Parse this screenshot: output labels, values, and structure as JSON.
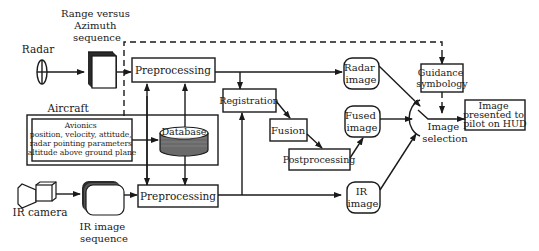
{
  "diagram": {
    "sources": {
      "radar": "Radar",
      "range_azimuth": [
        "Range versus",
        "Azimuth",
        "sequence"
      ],
      "ir_camera": "IR camera",
      "ir_sequence": [
        "IR image",
        "sequence"
      ]
    },
    "aircraft": {
      "label": "Aircraft",
      "avionics": {
        "title": "Avionics",
        "lines": [
          "position, velocity, attitude,",
          "radar pointing parameters",
          "altitude above ground plane"
        ]
      },
      "database": "Database"
    },
    "processing": {
      "preprocessing_top": "Preprocessing",
      "preprocessing_bottom": "Preprocessing",
      "registration": "Registration",
      "fusion": "Fusion",
      "postprocessing": "Postprocessing"
    },
    "images": {
      "radar_image": [
        "Radar",
        "image"
      ],
      "fused_image": [
        "Fused",
        "image"
      ],
      "ir_image": [
        "IR",
        "image"
      ]
    },
    "output": {
      "guidance": [
        "Guidance",
        "symbology"
      ],
      "image_selection": [
        "Image",
        "selection"
      ],
      "hud": [
        "Image",
        "presented to",
        "pilot on HUD"
      ]
    }
  }
}
